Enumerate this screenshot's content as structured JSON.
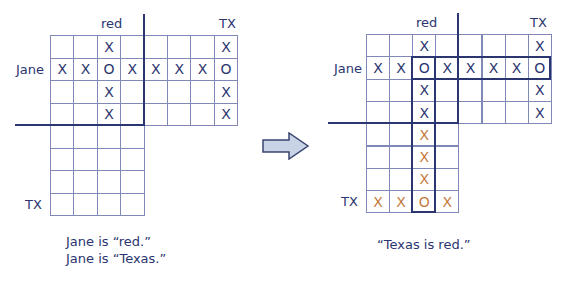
{
  "left_panel": {
    "col_label_red": "red",
    "col_label_tx": "TX",
    "row_label_jane": "Jane",
    "row_label_tx": "TX",
    "top_grid": [
      [
        "",
        "",
        "X",
        "",
        "",
        "",
        "",
        "X"
      ],
      [
        "X",
        "X",
        "O",
        "X",
        "X",
        "X",
        "X",
        "O"
      ],
      [
        "",
        "",
        "X",
        "",
        "",
        "",
        "",
        "X"
      ],
      [
        "",
        "",
        "X",
        "",
        "",
        "",
        "",
        "X"
      ]
    ],
    "bottom_grid": [
      [
        "",
        "",
        "",
        ""
      ],
      [
        "",
        "",
        "",
        ""
      ],
      [
        "",
        "",
        "",
        ""
      ],
      [
        "",
        "",
        "",
        ""
      ]
    ],
    "caption_line1": "Jane is “red.”",
    "caption_line2": "Jane is “Texas.”"
  },
  "arrow": {
    "icon": "right-arrow-icon",
    "fill": "#c9d3e6",
    "stroke": "#3a4570"
  },
  "right_panel": {
    "col_label_red": "red",
    "col_label_tx": "TX",
    "row_label_jane": "Jane",
    "row_label_tx": "TX",
    "top_grid": [
      [
        "",
        "",
        "X",
        "",
        "",
        "",
        "",
        "X"
      ],
      [
        "X",
        "X",
        "O",
        "X",
        "X",
        "X",
        "X",
        "O"
      ],
      [
        "",
        "",
        "X",
        "",
        "",
        "",
        "",
        "X"
      ],
      [
        "",
        "",
        "X",
        "",
        "",
        "",
        "",
        "X"
      ]
    ],
    "bottom_grid": [
      [
        "",
        "",
        "X",
        ""
      ],
      [
        "",
        "",
        "X",
        ""
      ],
      [
        "",
        "",
        "X",
        ""
      ],
      [
        "X",
        "X",
        "O",
        "X"
      ]
    ],
    "caption": "“Texas is red.”"
  },
  "colors": {
    "navy": "#2b3570",
    "orange": "#c47a3e",
    "gridline": "#8088b8"
  }
}
